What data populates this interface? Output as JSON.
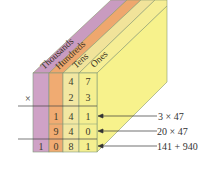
{
  "diagram": {
    "columns": [
      {
        "label": "Thousands",
        "color": "#c99bc0"
      },
      {
        "label": "Hundreds",
        "color": "#eea76e"
      },
      {
        "label": "Tens",
        "color": "#f1e39a"
      },
      {
        "label": "Ones",
        "color": "#f6f08e"
      }
    ],
    "times_sign": "×",
    "rows": [
      {
        "cells": [
          "",
          "",
          "4",
          "7"
        ]
      },
      {
        "cells": [
          "",
          "",
          "2",
          "3"
        ]
      },
      {
        "cells": [
          "",
          "1",
          "4",
          "1"
        ]
      },
      {
        "cells": [
          "",
          "9",
          "4",
          "0"
        ]
      },
      {
        "cells": [
          "1",
          "0",
          "8",
          "1"
        ]
      }
    ],
    "annotations": [
      {
        "text": "3 × 47"
      },
      {
        "text": "20 × 47"
      },
      {
        "text": "141 + 940"
      }
    ]
  }
}
